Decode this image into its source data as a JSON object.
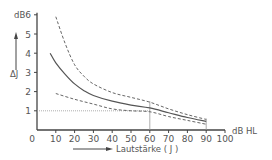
{
  "chart_data": {
    "type": "line",
    "title": "",
    "xlabel": "Lautstärke ( J )",
    "x_unit": "dB HL",
    "ylabel": "ΔJ",
    "y_unit": "dB",
    "xlim": [
      0,
      100
    ],
    "ylim": [
      0,
      6
    ],
    "x_ticks": [
      "0",
      "10",
      "20",
      "30",
      "40",
      "50",
      "60",
      "70",
      "80",
      "90",
      "100"
    ],
    "y_ticks": [
      "1",
      "2",
      "3",
      "4",
      "5",
      "6"
    ],
    "grid": false,
    "legend": null,
    "reference_lines": [
      {
        "orientation": "horizontal",
        "y": 1,
        "style": "dotted"
      },
      {
        "orientation": "vertical",
        "x": 60,
        "style": "solid"
      },
      {
        "orientation": "vertical",
        "x": 90,
        "style": "solid"
      }
    ],
    "series": [
      {
        "name": "upper bound",
        "style": "dashed",
        "x": [
          10,
          15,
          20,
          25,
          30,
          40,
          50,
          60,
          70,
          80,
          90
        ],
        "values": [
          5.9,
          4.5,
          3.4,
          2.8,
          2.4,
          1.95,
          1.7,
          1.45,
          1.1,
          0.8,
          0.55
        ]
      },
      {
        "name": "mean",
        "style": "solid",
        "x": [
          7,
          10,
          15,
          20,
          25,
          30,
          40,
          50,
          60,
          70,
          80,
          90
        ],
        "values": [
          4.0,
          3.5,
          2.9,
          2.4,
          2.05,
          1.8,
          1.5,
          1.3,
          1.15,
          0.9,
          0.65,
          0.45
        ]
      },
      {
        "name": "lower bound",
        "style": "dashed",
        "x": [
          10,
          20,
          30,
          40,
          50,
          60,
          70,
          80,
          90
        ],
        "values": [
          1.9,
          1.6,
          1.35,
          1.1,
          1.0,
          0.95,
          0.7,
          0.5,
          0.3
        ]
      }
    ]
  },
  "labels": {
    "y_unit": "dB",
    "y_symbol": "ΔJ",
    "x_unit": "dB HL",
    "x_title": "Lautstärke ( J )"
  },
  "colors": {
    "line": "#555555",
    "axis": "#444444",
    "reference": "#999999"
  }
}
